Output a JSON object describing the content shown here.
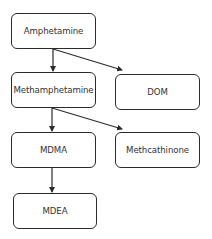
{
  "diagram": {
    "type": "flowchart",
    "nodes": [
      {
        "id": "amphetamine",
        "label": "Amphetamine"
      },
      {
        "id": "methamphetamine",
        "label": "Methamphetamine"
      },
      {
        "id": "dom",
        "label": "DOM"
      },
      {
        "id": "mdma",
        "label": "MDMA"
      },
      {
        "id": "methcathinone",
        "label": "Methcathinone"
      },
      {
        "id": "mdea",
        "label": "MDEA"
      }
    ],
    "edges": [
      {
        "from": "amphetamine",
        "to": "methamphetamine"
      },
      {
        "from": "amphetamine",
        "to": "dom"
      },
      {
        "from": "methamphetamine",
        "to": "mdma"
      },
      {
        "from": "methamphetamine",
        "to": "methcathinone"
      },
      {
        "from": "mdma",
        "to": "mdea"
      }
    ],
    "colors": {
      "stroke": "#2b2b2b",
      "text": "#333333",
      "background": "#ffffff"
    }
  }
}
